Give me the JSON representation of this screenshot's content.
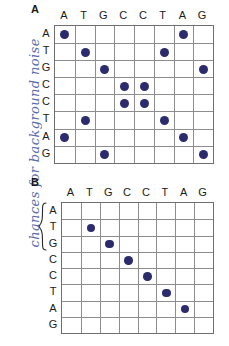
{
  "annotation": {
    "handwritten_note": "chances for background noise",
    "color": "#4a5fa8"
  },
  "style": {
    "dot_color": "#2b2b6e",
    "grid_line_color": "#8d8d8d",
    "grid_border_color": "#6f6f6f",
    "label_color": "#1a1a1a"
  },
  "panels": [
    {
      "letter": "A",
      "sequence_top": [
        "A",
        "T",
        "G",
        "C",
        "C",
        "T",
        "A",
        "G"
      ],
      "sequence_side": [
        "A",
        "T",
        "G",
        "C",
        "C",
        "T",
        "A",
        "G"
      ],
      "has_row_group_brace": false,
      "brace_rows": [],
      "dots": [
        [
          1,
          0,
          0,
          0,
          0,
          0,
          1,
          0
        ],
        [
          0,
          1,
          0,
          0,
          0,
          1,
          0,
          0
        ],
        [
          0,
          0,
          1,
          0,
          0,
          0,
          0,
          1
        ],
        [
          0,
          0,
          0,
          1,
          1,
          0,
          0,
          0
        ],
        [
          0,
          0,
          0,
          1,
          1,
          0,
          0,
          0
        ],
        [
          0,
          1,
          0,
          0,
          0,
          1,
          0,
          0
        ],
        [
          1,
          0,
          0,
          0,
          0,
          0,
          1,
          0
        ],
        [
          0,
          0,
          1,
          0,
          0,
          0,
          0,
          1
        ]
      ]
    },
    {
      "letter": "B",
      "sequence_top": [
        "A",
        "T",
        "G",
        "C",
        "C",
        "T",
        "A",
        "G"
      ],
      "sequence_side": [
        "A",
        "T",
        "G",
        "C",
        "C",
        "T",
        "A",
        "G"
      ],
      "has_row_group_brace": true,
      "brace_rows": [
        "A",
        "T",
        "G"
      ],
      "dots": [
        [
          0,
          0,
          0,
          0,
          0,
          0,
          0,
          0
        ],
        [
          0,
          1,
          0,
          0,
          0,
          0,
          0,
          0
        ],
        [
          0,
          0,
          1,
          0,
          0,
          0,
          0,
          0
        ],
        [
          0,
          0,
          0,
          1,
          0,
          0,
          0,
          0
        ],
        [
          0,
          0,
          0,
          0,
          1,
          0,
          0,
          0
        ],
        [
          0,
          0,
          0,
          0,
          0,
          1,
          0,
          0
        ],
        [
          0,
          0,
          0,
          0,
          0,
          0,
          1,
          0
        ],
        [
          0,
          0,
          0,
          0,
          0,
          0,
          0,
          0
        ]
      ]
    }
  ]
}
